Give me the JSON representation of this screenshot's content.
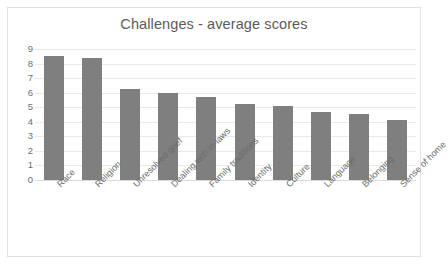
{
  "chart_data": {
    "type": "bar",
    "title": "Challenges - average scores",
    "xlabel": "",
    "ylabel": "",
    "ylim": [
      0,
      9
    ],
    "ytick_labels": [
      "9",
      "8",
      "7",
      "6",
      "5",
      "4",
      "3",
      "2",
      "1",
      "0"
    ],
    "yticks": [
      9,
      8,
      7,
      6,
      5,
      4,
      3,
      2,
      1,
      0
    ],
    "grid": true,
    "legend": "none",
    "bar_color": "#7f7f7f",
    "categories": [
      "Race",
      "Religion",
      "Unresolved grief",
      "Dealing with in-laws",
      "Family traditions",
      "Identity",
      "Culture",
      "Language",
      "Belonging",
      "Sense of home"
    ],
    "values": [
      8.5,
      8.4,
      6.25,
      5.95,
      5.7,
      5.2,
      5.05,
      4.65,
      4.5,
      4.1
    ]
  }
}
